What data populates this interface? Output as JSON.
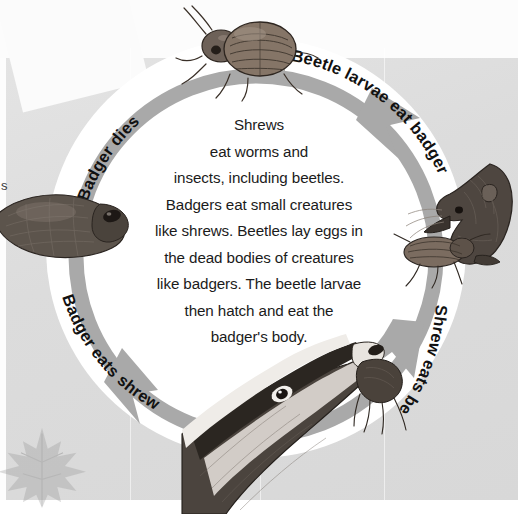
{
  "page": {
    "kind": "textbook-diagram",
    "edge_letter": "s",
    "colors": {
      "background_grey": "#dcdcdc",
      "ring_arrow_grey": "#a8a8a8",
      "ring_white": "#ffffff",
      "text_black": "#1b1b1b",
      "leaf_watermark": "#9a9a9a"
    }
  },
  "center_paragraph": {
    "text": "Shrews\neat worms and\ninsects, including beetles.\nBadgers eat small creatures\nlike shrews. Beetles lay eggs in\nthe dead bodies of creatures\nlike badgers. The beetle larvae\nthen hatch and eat the\nbadger's body.",
    "lines": [
      "Shrews",
      "eat worms and",
      "insects, including beetles.",
      "Badgers eat small creatures",
      "like shrews. Beetles lay eggs in",
      "the dead bodies of creatures",
      "like badgers. The beetle larvae",
      "then hatch and eat the",
      "badger's body."
    ]
  },
  "cycle": {
    "direction": "clockwise",
    "labels": [
      {
        "id": "beetle-larvae-eat-badger",
        "text": "Beetle larvae eat badger",
        "position": "top-right"
      },
      {
        "id": "shrew-eats-beetle",
        "text": "Shrew eats beetle",
        "position": "bottom-right"
      },
      {
        "id": "badger-eats-shrew",
        "text": "Badger eats shrew",
        "position": "bottom-left"
      },
      {
        "id": "badger-dies",
        "text": "Badger dies",
        "position": "top-left"
      }
    ],
    "illustrations": [
      {
        "id": "beetle",
        "label": "beetle",
        "position": "top"
      },
      {
        "id": "shrew-eating-beetle",
        "label": "shrew eating a beetle",
        "position": "right"
      },
      {
        "id": "badger-eating-shrew",
        "label": "badger eating a shrew",
        "position": "bottom"
      },
      {
        "id": "dead-badger",
        "label": "dead badger",
        "position": "left"
      }
    ]
  }
}
